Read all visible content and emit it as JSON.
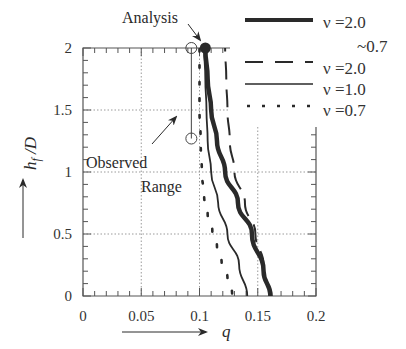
{
  "chart_data": {
    "type": "line",
    "title": "",
    "xlabel": "q",
    "ylabel": "h_f /D",
    "xlim": [
      0,
      0.2
    ],
    "ylim": [
      0,
      2
    ],
    "x_ticks": [
      "0",
      "0.05",
      "0.1",
      "0.15",
      "0.2"
    ],
    "y_ticks": [
      "0",
      "0.5",
      "1",
      "1.5",
      "2"
    ],
    "grid": "dotted",
    "legend_position": "upper right (outside plot frame)",
    "series": [
      {
        "name": "ν =2.0 ~0.7",
        "style": "thick-solid",
        "points": [
          [
            0.161,
            0.0
          ],
          [
            0.155,
            0.2
          ],
          [
            0.145,
            0.5
          ],
          [
            0.133,
            0.75
          ],
          [
            0.122,
            1.0
          ],
          [
            0.115,
            1.25
          ],
          [
            0.11,
            1.5
          ],
          [
            0.107,
            1.75
          ],
          [
            0.105,
            2.0
          ]
        ]
      },
      {
        "name": "ν =2.0",
        "style": "dashed",
        "points": [
          [
            0.16,
            0.0
          ],
          [
            0.155,
            0.25
          ],
          [
            0.148,
            0.5
          ],
          [
            0.139,
            0.75
          ],
          [
            0.13,
            1.0
          ],
          [
            0.126,
            1.25
          ],
          [
            0.124,
            1.5
          ],
          [
            0.123,
            1.75
          ],
          [
            0.122,
            2.0
          ]
        ]
      },
      {
        "name": "ν =1.0",
        "style": "thin-solid",
        "points": [
          [
            0.141,
            0.0
          ],
          [
            0.134,
            0.25
          ],
          [
            0.124,
            0.5
          ],
          [
            0.116,
            0.75
          ],
          [
            0.11,
            1.0
          ],
          [
            0.107,
            1.25
          ],
          [
            0.106,
            1.5
          ],
          [
            0.105,
            1.75
          ],
          [
            0.104,
            2.0
          ]
        ]
      },
      {
        "name": "ν =0.7",
        "style": "dotted",
        "points": [
          [
            0.128,
            0.02
          ],
          [
            0.124,
            0.15
          ],
          [
            0.119,
            0.27
          ],
          [
            0.115,
            0.4
          ],
          [
            0.111,
            0.53
          ],
          [
            0.107,
            0.66
          ],
          [
            0.104,
            0.8
          ],
          [
            0.102,
            1.0
          ],
          [
            0.101,
            1.25
          ],
          [
            0.1,
            1.5
          ],
          [
            0.1,
            1.75
          ],
          [
            0.1,
            2.0
          ]
        ]
      }
    ],
    "markers": {
      "analysis_point": {
        "q": 0.105,
        "h": 2.0,
        "label": "Analysis"
      },
      "observed_range": {
        "q": 0.093,
        "h_top": 2.0,
        "h_bottom": 1.27,
        "label_line1": "Observed",
        "label_line2": "Range"
      }
    }
  },
  "legend": [
    {
      "label": "ν =2.0",
      "label2": "~0.7",
      "style": "thick-solid"
    },
    {
      "label": "ν =2.0",
      "style": "dashed"
    },
    {
      "label": "ν =1.0",
      "style": "thin-solid"
    },
    {
      "label": "ν =0.7",
      "style": "dotted"
    }
  ],
  "annotations": {
    "analysis": "Analysis",
    "observed_1": "Observed",
    "observed_2": "Range"
  },
  "axes": {
    "x_title": "q",
    "y_title_main": "h",
    "y_title_sub": "f",
    "y_title_tail": " /D"
  },
  "colors": {
    "line": "#2a2a2a",
    "grid": "#9a9a9a",
    "frame": "#555555"
  }
}
